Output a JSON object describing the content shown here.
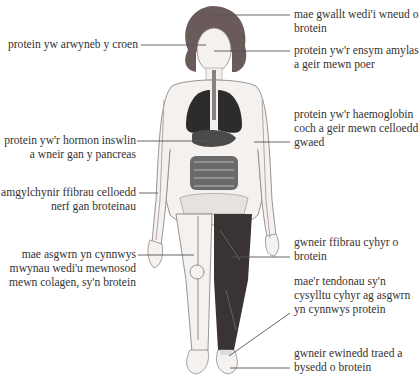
{
  "diagram": {
    "colors": {
      "skin": "#f4f1ee",
      "outline": "#7a7a7a",
      "hair": "#6a5a5a",
      "lungs": "#2c2c2c",
      "organs": "#4a4a4a",
      "muscle": "#3a3333",
      "leader_line": "#555555"
    },
    "labels_left": [
      {
        "id": "skin",
        "lines": [
          "protein yw arwyneb y croen"
        ]
      },
      {
        "id": "insulin",
        "lines": [
          "protein yw'r hormon inswlin",
          "a wneir gan y pancreas"
        ]
      },
      {
        "id": "nerve",
        "lines": [
          "amgylchynir ffibrau celloedd",
          "nerf gan broteinau"
        ]
      },
      {
        "id": "bone",
        "lines": [
          "mae asgwrn yn cynnwys",
          "mwynau wedi'u mewnosod",
          "mewn colagen, sy'n brotein"
        ]
      }
    ],
    "labels_right": [
      {
        "id": "hair",
        "lines": [
          "mae gwallt wedi'i wneud o",
          "brotein"
        ]
      },
      {
        "id": "amylase",
        "lines": [
          "protein yw'r ensym amylas",
          "a geir mewn poer"
        ]
      },
      {
        "id": "haemoglobin",
        "lines": [
          "protein yw'r haemoglobin",
          "coch a geir mewn celloedd",
          "gwaed"
        ]
      },
      {
        "id": "muscle",
        "lines": [
          "gwneir ffibrau cyhyr o",
          "brotein"
        ]
      },
      {
        "id": "tendon",
        "lines": [
          "mae'r tendonau sy'n",
          "cysylltu cyhyr ag asgwrn",
          "yn cynnwys protein"
        ]
      },
      {
        "id": "nails",
        "lines": [
          "gwneir ewinedd traed a",
          "bysedd o brotein"
        ]
      }
    ]
  }
}
